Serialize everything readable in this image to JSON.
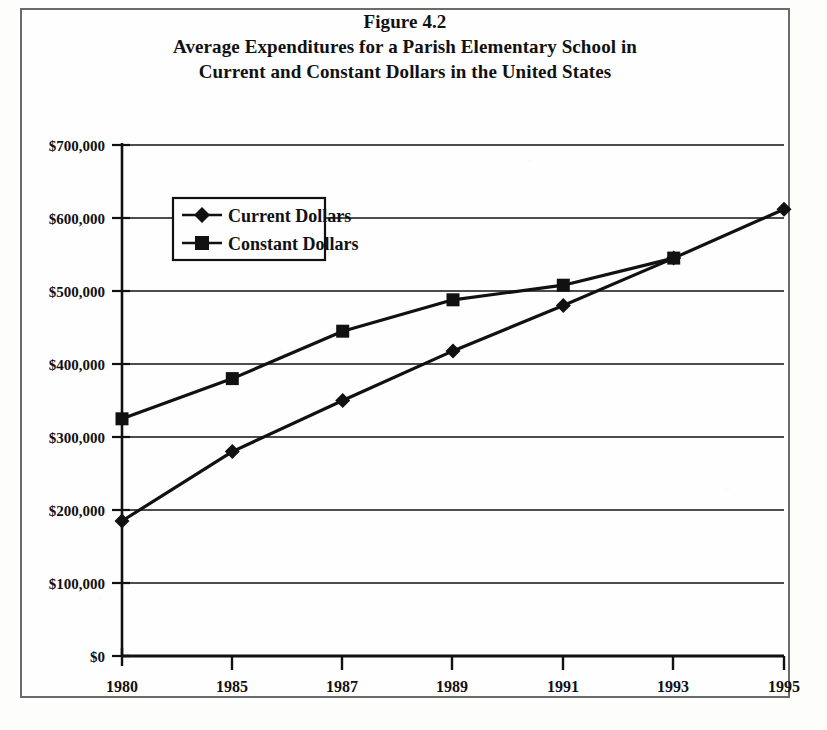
{
  "figure": {
    "label": "Figure 4.2",
    "title_line_1": "Average Expenditures for a Parish Elementary School in",
    "title_line_2": "Current and Constant Dollars in the United States"
  },
  "chart_data": {
    "type": "line",
    "xlabel": "",
    "ylabel": "",
    "categories": [
      "1980",
      "1985",
      "1987",
      "1989",
      "1991",
      "1993",
      "1995"
    ],
    "series": [
      {
        "name": "Current Dollars",
        "marker": "diamond",
        "values": [
          185000,
          280000,
          350000,
          418000,
          480000,
          545000,
          612000
        ]
      },
      {
        "name": "Constant Dollars",
        "marker": "square",
        "values": [
          325000,
          380000,
          445000,
          488000,
          508000,
          545000,
          null
        ]
      }
    ],
    "ylim": [
      0,
      700000
    ],
    "ytick_values": [
      0,
      100000,
      200000,
      300000,
      400000,
      500000,
      600000,
      700000
    ],
    "ytick_labels": [
      "$0",
      "$100,000",
      "$200,000",
      "$300,000",
      "$400,000",
      "$500,000",
      "$600,000",
      "$700,000"
    ],
    "grid": true,
    "grid_axis": "y",
    "legend_position": "upper-left-inside",
    "line_color": "#111111",
    "marker_color": "#111111"
  },
  "legend": {
    "items": [
      {
        "label": "Current Dollars",
        "marker": "diamond-marker"
      },
      {
        "label": "Constant Dollars",
        "marker": "square-marker"
      }
    ]
  },
  "axes": {
    "y_labels": [
      "$700,000",
      "$600,000",
      "$500,000",
      "$400,000",
      "$300,000",
      "$200,000",
      "$100,000",
      "$0"
    ],
    "x_labels": [
      "1980",
      "1985",
      "1987",
      "1989",
      "1991",
      "1993",
      "1995"
    ]
  }
}
